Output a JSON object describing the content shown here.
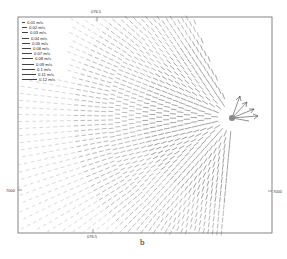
{
  "figure": {
    "caption": "b",
    "axes": {
      "top_tick_label": "076.5",
      "bottom_tick_label": "076.5",
      "left_tick_label": "7000",
      "right_tick_label": "7000"
    },
    "legend": {
      "entries": [
        {
          "label": "0.01 m/s",
          "arrow_len": 3
        },
        {
          "label": "0.02 m/s",
          "arrow_len": 5
        },
        {
          "label": "0.03 m/s",
          "arrow_len": 6
        },
        {
          "label": "0.04 m/s",
          "arrow_len": 7
        },
        {
          "label": "0.05 m/s",
          "arrow_len": 8
        },
        {
          "label": "0.06 m/s",
          "arrow_len": 9
        },
        {
          "label": "0.07 m/s",
          "arrow_len": 10
        },
        {
          "label": "0.08 m/s",
          "arrow_len": 11
        },
        {
          "label": "0.09 m/s",
          "arrow_len": 12
        },
        {
          "label": "0.1 m/s",
          "arrow_len": 13
        },
        {
          "label": "0.11 m/s",
          "arrow_len": 14
        },
        {
          "label": "0.12 m/s",
          "arrow_len": 15
        }
      ]
    },
    "colors": {
      "frame": "#555555",
      "arrows": "#333333",
      "light_arrows": "#aaaaaa"
    }
  }
}
